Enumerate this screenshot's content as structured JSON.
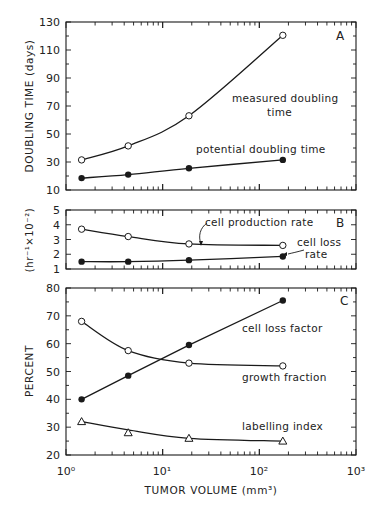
{
  "figure": {
    "xlabel": "TUMOR VOLUME (mm³)",
    "x_tick_labels": [
      "10⁰",
      "10¹",
      "10²",
      "10³"
    ]
  },
  "chart_data": [
    {
      "type": "line",
      "panel": "A",
      "title": "",
      "xlabel": "TUMOR VOLUME (mm³)",
      "ylabel": "DOUBLING TIME (days)",
      "xscale": "log",
      "xlim": [
        1,
        1000
      ],
      "ylim": [
        10,
        130
      ],
      "yticks": [
        10,
        30,
        50,
        70,
        90,
        110,
        130
      ],
      "x": [
        1.45,
        4.4,
        18.7,
        175
      ],
      "series": [
        {
          "name": "measured doubling time",
          "marker": "open-circle",
          "values": [
            31.5,
            41.5,
            63,
            120.5
          ]
        },
        {
          "name": "potential doubling time",
          "marker": "filled-circle",
          "values": [
            18.5,
            21,
            25.5,
            31.5
          ]
        }
      ],
      "annotations": [
        "measured doubling time",
        "potential doubling time",
        "A"
      ]
    },
    {
      "type": "line",
      "panel": "B",
      "title": "",
      "xlabel": "TUMOR VOLUME (mm³)",
      "ylabel": "(hr⁻¹×10⁻²)",
      "xscale": "log",
      "xlim": [
        1,
        1000
      ],
      "ylim": [
        1,
        5
      ],
      "yticks": [
        1,
        2,
        3,
        4,
        5
      ],
      "x": [
        1.45,
        4.4,
        18.7,
        175
      ],
      "series": [
        {
          "name": "cell production rate",
          "marker": "open-circle",
          "values": [
            3.7,
            3.2,
            2.7,
            2.6
          ]
        },
        {
          "name": "cell loss rate",
          "marker": "filled-circle",
          "values": [
            1.5,
            1.5,
            1.6,
            1.85
          ]
        }
      ],
      "annotations": [
        "cell production rate",
        "cell loss rate",
        "B"
      ]
    },
    {
      "type": "line",
      "panel": "C",
      "title": "",
      "xlabel": "TUMOR VOLUME (mm³)",
      "ylabel": "PERCENT",
      "xscale": "log",
      "xlim": [
        1,
        1000
      ],
      "ylim": [
        20,
        80
      ],
      "yticks": [
        20,
        30,
        40,
        50,
        60,
        70,
        80
      ],
      "x": [
        1.45,
        4.4,
        18.7,
        175
      ],
      "series": [
        {
          "name": "cell loss factor",
          "marker": "filled-circle",
          "values": [
            40,
            48.5,
            59.5,
            75.5
          ]
        },
        {
          "name": "growth fraction",
          "marker": "open-circle",
          "values": [
            68,
            57.5,
            53,
            52
          ]
        },
        {
          "name": "labelling index",
          "marker": "open-triangle",
          "values": [
            32,
            28,
            26,
            25
          ]
        }
      ],
      "annotations": [
        "cell loss factor",
        "growth fraction",
        "labelling index",
        "C"
      ]
    }
  ],
  "panels": {
    "A": {
      "letter": "A",
      "ylabel": "DOUBLING TIME (days)",
      "labels": {
        "measured_1": "measured doubling",
        "measured_2": "time",
        "potential": "potential doubling time"
      }
    },
    "B": {
      "letter": "B",
      "ylabel": "(hr⁻¹×10⁻²)",
      "labels": {
        "production": "cell production rate",
        "loss_1": "cell loss",
        "loss_2": "rate"
      }
    },
    "C": {
      "letter": "C",
      "ylabel": "PERCENT",
      "labels": {
        "clf": "cell loss factor",
        "gf": "growth fraction",
        "li": "labelling index"
      }
    }
  },
  "colors": {
    "ink": "#1a1a1a",
    "background": "#ffffff"
  }
}
